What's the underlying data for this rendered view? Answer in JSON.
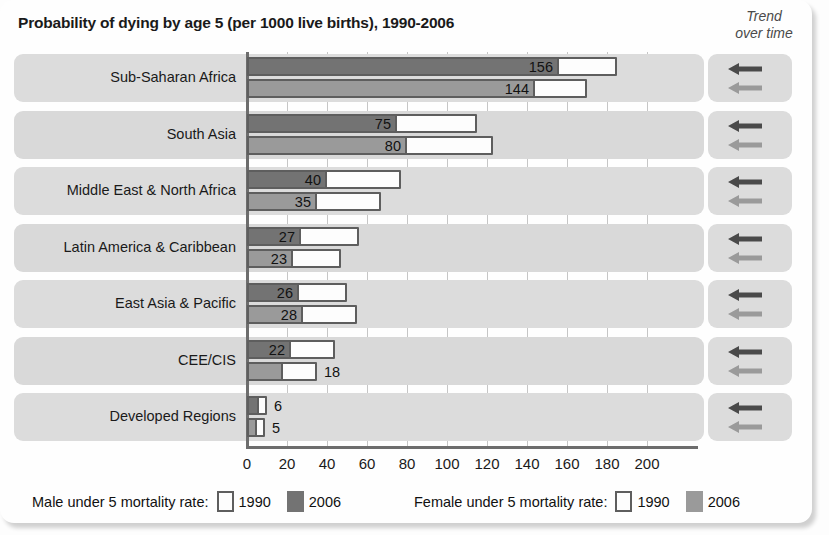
{
  "title": "Probability of dying by age 5 (per 1000 live births), 1990-2006",
  "trend_header": {
    "line1": "Trend",
    "line2": "over time"
  },
  "axis": {
    "ticks": [
      "0",
      "20",
      "40",
      "60",
      "80",
      "100",
      "120",
      "140",
      "160",
      "180",
      "200"
    ]
  },
  "legend": {
    "male_label": "Male under 5 mortality rate:",
    "female_label": "Female under 5 mortality rate:",
    "year_1990": "1990",
    "year_2006": "2006"
  },
  "colors": {
    "male_2006": "#737373",
    "female_2006": "#9a9a9a",
    "bar_1990_fill": "#fdfdfd",
    "bar_outline": "#5e5e5e",
    "row_band": "#dcdcdc",
    "axis": "#6d6d6d",
    "arrow_male": "#4a4a4a",
    "arrow_female": "#9a9a9a"
  },
  "icons": {
    "trend_arrow": "arrow-left-icon"
  },
  "rows": [
    {
      "label": "Sub-Saharan Africa",
      "male_2006": 156,
      "male_1990": 185,
      "female_2006": 144,
      "female_1990": 170,
      "trend": "decreasing"
    },
    {
      "label": "South Asia",
      "male_2006": 75,
      "male_1990": 115,
      "female_2006": 80,
      "female_1990": 123,
      "trend": "decreasing"
    },
    {
      "label": "Middle East & North Africa",
      "male_2006": 40,
      "male_1990": 77,
      "female_2006": 35,
      "female_1990": 67,
      "trend": "decreasing"
    },
    {
      "label": "Latin America & Caribbean",
      "male_2006": 27,
      "male_1990": 56,
      "female_2006": 23,
      "female_1990": 47,
      "trend": "decreasing"
    },
    {
      "label": "East Asia & Pacific",
      "male_2006": 26,
      "male_1990": 50,
      "female_2006": 28,
      "female_1990": 55,
      "trend": "decreasing"
    },
    {
      "label": "CEE/CIS",
      "male_2006": 22,
      "male_1990": 44,
      "female_2006": 18,
      "female_1990": 35,
      "trend": "decreasing"
    },
    {
      "label": "Developed Regions",
      "male_2006": 6,
      "male_1990": 10,
      "female_2006": 5,
      "female_1990": 9,
      "trend": "decreasing"
    }
  ],
  "chart_data": {
    "type": "bar",
    "orientation": "horizontal",
    "title": "Probability of dying by age 5 (per 1000 live births), 1990-2006",
    "xlabel": "",
    "ylabel": "",
    "xlim": [
      0,
      200
    ],
    "xticks": [
      0,
      20,
      40,
      60,
      80,
      100,
      120,
      140,
      160,
      180,
      200
    ],
    "grid": true,
    "legend_position": "bottom",
    "categories": [
      "Sub-Saharan Africa",
      "South Asia",
      "Middle East & North Africa",
      "Latin America & Caribbean",
      "East Asia & Pacific",
      "CEE/CIS",
      "Developed Regions"
    ],
    "series": [
      {
        "name": "Male under 5 mortality rate, 1990",
        "values": [
          185,
          115,
          77,
          56,
          50,
          44,
          10
        ],
        "labeled": false,
        "style": "outline-white"
      },
      {
        "name": "Male under 5 mortality rate, 2006",
        "values": [
          156,
          75,
          40,
          27,
          26,
          22,
          6
        ],
        "labeled": true,
        "style": "fill-dark-gray"
      },
      {
        "name": "Female under 5 mortality rate, 1990",
        "values": [
          170,
          123,
          67,
          47,
          55,
          35,
          9
        ],
        "labeled": false,
        "style": "outline-white"
      },
      {
        "name": "Female under 5 mortality rate, 2006",
        "values": [
          144,
          80,
          35,
          23,
          28,
          18,
          5
        ],
        "labeled": true,
        "style": "fill-mid-gray"
      }
    ],
    "annotations": {
      "trend_over_time": [
        "decreasing",
        "decreasing",
        "decreasing",
        "decreasing",
        "decreasing",
        "decreasing",
        "decreasing"
      ]
    }
  }
}
